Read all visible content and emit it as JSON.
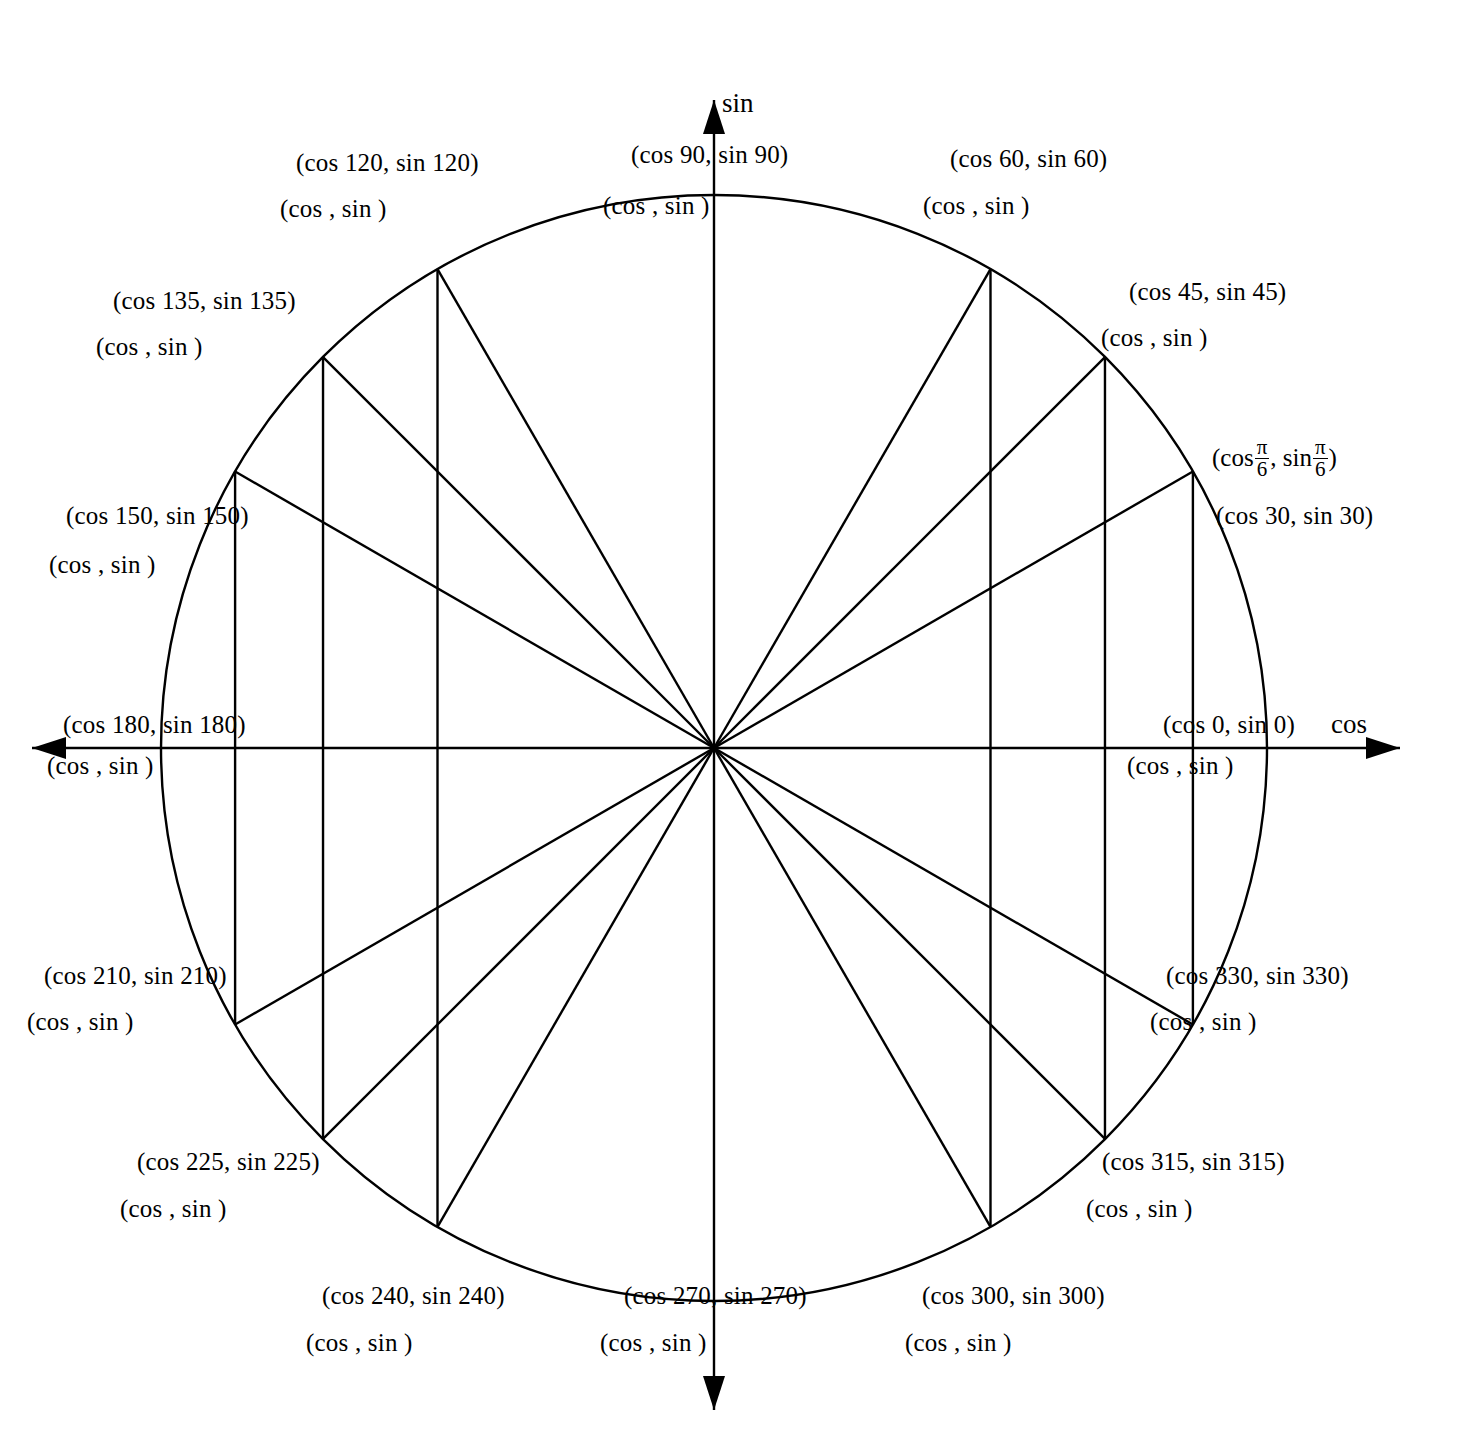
{
  "figure": {
    "type": "unit-circle-worksheet",
    "center": {
      "x": 714,
      "y": 748
    },
    "radius": 553,
    "stroke_color": "#000000",
    "background_color": "#ffffff"
  },
  "axes": {
    "horizontal_label": "cos",
    "vertical_label": "sin",
    "horizontal": {
      "x1": 32,
      "x2": 1400,
      "y": 748
    },
    "vertical": {
      "y1": 100,
      "y2": 1410,
      "x": 714
    }
  },
  "sample_label": {
    "prefix": "(cos",
    "numerator": "π",
    "denominator": "6",
    "middle": ",  sin",
    "suffix": ")",
    "angle_deg": 30
  },
  "chart_data": {
    "type": "scatter",
    "xlabel": "cos",
    "ylabel": "sin",
    "xlim": [
      -1,
      1
    ],
    "ylim": [
      -1,
      1
    ],
    "grid": false,
    "legend": "none",
    "angles_deg": [
      0,
      30,
      45,
      60,
      90,
      120,
      135,
      150,
      180,
      210,
      225,
      240,
      270,
      300,
      315,
      330
    ],
    "points": [
      {
        "angle": 0,
        "x": 1.0,
        "y": 0.0,
        "has_drop_line": false
      },
      {
        "angle": 30,
        "x": 0.866,
        "y": 0.5,
        "has_drop_line": true
      },
      {
        "angle": 45,
        "x": 0.707,
        "y": 0.707,
        "has_drop_line": true
      },
      {
        "angle": 60,
        "x": 0.5,
        "y": 0.866,
        "has_drop_line": true
      },
      {
        "angle": 90,
        "x": 0.0,
        "y": 1.0,
        "has_drop_line": false
      },
      {
        "angle": 120,
        "x": -0.5,
        "y": 0.866,
        "has_drop_line": true
      },
      {
        "angle": 135,
        "x": -0.707,
        "y": 0.707,
        "has_drop_line": true
      },
      {
        "angle": 150,
        "x": -0.866,
        "y": 0.5,
        "has_drop_line": true
      },
      {
        "angle": 180,
        "x": -1.0,
        "y": 0.0,
        "has_drop_line": false
      },
      {
        "angle": 210,
        "x": -0.866,
        "y": -0.5,
        "has_drop_line": true
      },
      {
        "angle": 225,
        "x": -0.707,
        "y": -0.707,
        "has_drop_line": true
      },
      {
        "angle": 240,
        "x": -0.5,
        "y": -0.866,
        "has_drop_line": true
      },
      {
        "angle": 270,
        "x": 0.0,
        "y": -1.0,
        "has_drop_line": false
      },
      {
        "angle": 300,
        "x": 0.5,
        "y": -0.866,
        "has_drop_line": true
      },
      {
        "angle": 315,
        "x": 0.707,
        "y": -0.707,
        "has_drop_line": true
      },
      {
        "angle": 330,
        "x": 0.866,
        "y": -0.5,
        "has_drop_line": true
      }
    ]
  },
  "labels": [
    {
      "angle": 0,
      "degree_text": "(cos 0,  sin 0)",
      "blank_text": "(cos        , sin        )",
      "deg_x": 1163,
      "deg_y": 712,
      "blank_x": 1127,
      "blank_y": 753
    },
    {
      "angle": 30,
      "degree_text": "(cos 30,  sin 30)",
      "blank_text": "",
      "deg_x": 1216,
      "deg_y": 503,
      "blank_x": 0,
      "blank_y": 0
    },
    {
      "angle": 45,
      "degree_text": "(cos 45,  sin 45)",
      "blank_text": "(cos        , sin        )",
      "deg_x": 1129,
      "deg_y": 279,
      "blank_x": 1101,
      "blank_y": 325
    },
    {
      "angle": 60,
      "degree_text": "(cos 60,  sin 60)",
      "blank_text": "(cos        , sin        )",
      "deg_x": 950,
      "deg_y": 146,
      "blank_x": 923,
      "blank_y": 193
    },
    {
      "angle": 90,
      "degree_text": "(cos 90,  sin 90)",
      "blank_text": "(cos        , sin        )",
      "deg_x": 631,
      "deg_y": 142,
      "blank_x": 603,
      "blank_y": 193
    },
    {
      "angle": 120,
      "degree_text": "(cos 120,  sin 120)",
      "blank_text": "(cos        , sin        )",
      "deg_x": 296,
      "deg_y": 150,
      "blank_x": 280,
      "blank_y": 196
    },
    {
      "angle": 135,
      "degree_text": "(cos 135,  sin 135)",
      "blank_text": "(cos        , sin        )",
      "deg_x": 113,
      "deg_y": 288,
      "blank_x": 96,
      "blank_y": 334
    },
    {
      "angle": 150,
      "degree_text": "(cos 150,  sin 150)",
      "blank_text": "(cos        , sin        )",
      "deg_x": 66,
      "deg_y": 503,
      "blank_x": 49,
      "blank_y": 552
    },
    {
      "angle": 180,
      "degree_text": "(cos 180,  sin 180)",
      "blank_text": "(cos        , sin        )",
      "deg_x": 63,
      "deg_y": 712,
      "blank_x": 47,
      "blank_y": 753
    },
    {
      "angle": 210,
      "degree_text": "(cos 210,  sin 210)",
      "blank_text": "(cos        , sin        )",
      "deg_x": 44,
      "deg_y": 963,
      "blank_x": 27,
      "blank_y": 1009
    },
    {
      "angle": 225,
      "degree_text": "(cos 225,  sin 225)",
      "blank_text": "(cos        , sin        )",
      "deg_x": 137,
      "deg_y": 1149,
      "blank_x": 120,
      "blank_y": 1196
    },
    {
      "angle": 240,
      "degree_text": "(cos 240,  sin 240)",
      "blank_text": "(cos        , sin        )",
      "deg_x": 322,
      "deg_y": 1283,
      "blank_x": 306,
      "blank_y": 1330
    },
    {
      "angle": 270,
      "degree_text": "(cos 270,  sin 270)",
      "blank_text": "(cos        , sin        )",
      "deg_x": 624,
      "deg_y": 1283,
      "blank_x": 600,
      "blank_y": 1330
    },
    {
      "angle": 300,
      "degree_text": "(cos 300,  sin 300)",
      "blank_text": "(cos        , sin        )",
      "deg_x": 922,
      "deg_y": 1283,
      "blank_x": 905,
      "blank_y": 1330
    },
    {
      "angle": 315,
      "degree_text": "(cos 315,  sin 315)",
      "blank_text": "(cos        , sin        )",
      "deg_x": 1102,
      "deg_y": 1149,
      "blank_x": 1086,
      "blank_y": 1196
    },
    {
      "angle": 330,
      "degree_text": "(cos 330,  sin 330)",
      "blank_text": "(cos        , sin        )",
      "deg_x": 1166,
      "deg_y": 963,
      "blank_x": 1150,
      "blank_y": 1009
    }
  ]
}
